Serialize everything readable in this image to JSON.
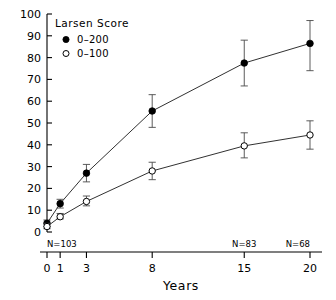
{
  "chart_data": {
    "type": "line",
    "title": "",
    "xlabel": "Years",
    "ylabel": "",
    "x": [
      0,
      1,
      3,
      8,
      15,
      20
    ],
    "categories": [
      "0",
      "1",
      "3",
      "8",
      "15",
      "20"
    ],
    "xlim": [
      0,
      20
    ],
    "ylim": [
      0,
      100
    ],
    "grid": false,
    "legend_position": "top-left",
    "legend_title": "Larsen Score",
    "y_ticks": [
      0,
      10,
      20,
      30,
      40,
      50,
      60,
      70,
      80,
      90,
      100
    ],
    "y_tick_labels": [
      "0",
      "10",
      "20",
      "30",
      "40",
      "50",
      "60",
      "70",
      "80",
      "90",
      "100"
    ],
    "x_ticks": [
      0,
      1,
      3,
      8,
      15,
      20
    ],
    "x_tick_labels": [
      "0",
      "1",
      "3",
      "8",
      "15",
      "20"
    ],
    "series": [
      {
        "name": "0-200",
        "marker": "filled-circle",
        "values": [
          4,
          13,
          27,
          55.5,
          77.5,
          86.5
        ],
        "err_low": [
          2.5,
          11,
          23,
          48,
          67,
          74
        ],
        "err_high": [
          5.5,
          15,
          31,
          63,
          88,
          97
        ]
      },
      {
        "name": "0-100",
        "marker": "open-circle",
        "values": [
          2.5,
          7,
          14,
          28,
          39.5,
          44.5
        ],
        "err_low": [
          1.5,
          6,
          12,
          24,
          34,
          38
        ],
        "err_high": [
          4,
          8.5,
          16.5,
          32,
          45.5,
          51
        ]
      }
    ],
    "annotations": [
      {
        "text": "N=103",
        "x": 0,
        "anchor": "start"
      },
      {
        "text": "N=83",
        "x": 15,
        "anchor": "middle"
      },
      {
        "text": "N=68",
        "x": 20,
        "anchor": "end"
      }
    ]
  },
  "legend": {
    "title": "Larsen Score",
    "items": [
      {
        "label": "0–200",
        "marker": "filled-circle"
      },
      {
        "label": "0–100",
        "marker": "open-circle"
      }
    ]
  },
  "axis": {
    "x_title": "Years"
  }
}
